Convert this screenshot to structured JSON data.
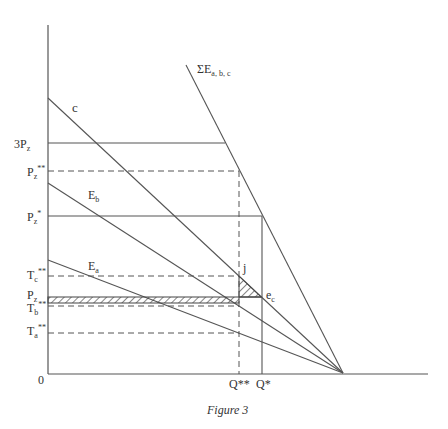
{
  "figure": {
    "caption": "Figure 3",
    "origin_label": "0",
    "line_color": "#555555",
    "y_axis_labels": [
      {
        "id": "3pz",
        "main": "3P",
        "sub": "z",
        "sup": "",
        "y": 143
      },
      {
        "id": "pz2",
        "main": "P",
        "sub": "z",
        "sup": "**",
        "y": 171
      },
      {
        "id": "pz1",
        "main": "P",
        "sub": "z",
        "sup": "*",
        "y": 216
      },
      {
        "id": "tc2",
        "main": "T",
        "sub": "c",
        "sup": "**",
        "y": 276
      },
      {
        "id": "pz",
        "main": "P",
        "sub": "z",
        "sup": "",
        "y": 297
      },
      {
        "id": "tb2",
        "main": "T",
        "sub": "b",
        "sup": "**",
        "y": 306
      },
      {
        "id": "ta2",
        "main": "T",
        "sub": "a",
        "sup": "**",
        "y": 333
      }
    ],
    "x_axis_labels": [
      {
        "id": "q2",
        "text": "Q**",
        "x": 239
      },
      {
        "id": "q1",
        "text": "Q*",
        "x": 262
      }
    ],
    "curve_labels": {
      "c": "c",
      "eb_main": "E",
      "eb_sub": "b",
      "ea_main": "E",
      "ea_sub": "a",
      "sum_main": "ΣE",
      "sum_sub": "a, b, c",
      "j": "j",
      "ec_main": "e",
      "ec_sub": "c"
    }
  }
}
